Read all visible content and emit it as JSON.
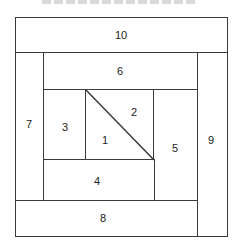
{
  "diagram": {
    "type": "log-cabin-quilt-block",
    "line_color": "#3a3a3a",
    "pieces": [
      {
        "id": "10",
        "label": "10",
        "x": 15,
        "y": 17,
        "w": 213,
        "h": 36
      },
      {
        "id": "7",
        "label": "7",
        "x": 15,
        "y": 52,
        "w": 30,
        "h": 149
      },
      {
        "id": "9",
        "label": "9",
        "x": 196,
        "y": 52,
        "w": 32,
        "h": 184
      },
      {
        "id": "6",
        "label": "6",
        "x": 44,
        "y": 52,
        "w": 153,
        "h": 39
      },
      {
        "id": "3",
        "label": "3",
        "x": 44,
        "y": 90,
        "w": 43,
        "h": 71
      },
      {
        "id": "5",
        "label": "5",
        "x": 153,
        "y": 90,
        "w": 44,
        "h": 111
      },
      {
        "id": "4",
        "label": "4",
        "x": 44,
        "y": 160,
        "w": 110,
        "h": 41
      },
      {
        "id": "8",
        "label": "8",
        "x": 15,
        "y": 200,
        "w": 182,
        "h": 36
      }
    ],
    "center": {
      "x": 86,
      "y": 90,
      "w": 67,
      "h": 70,
      "triangles": [
        {
          "id": "1",
          "label": "1"
        },
        {
          "id": "2",
          "label": "2"
        }
      ]
    },
    "labels": {
      "p10": "10",
      "p7": "7",
      "p9": "9",
      "p6": "6",
      "p3": "3",
      "p5": "5",
      "p4": "4",
      "p8": "8",
      "p1": "1",
      "p2": "2"
    }
  }
}
